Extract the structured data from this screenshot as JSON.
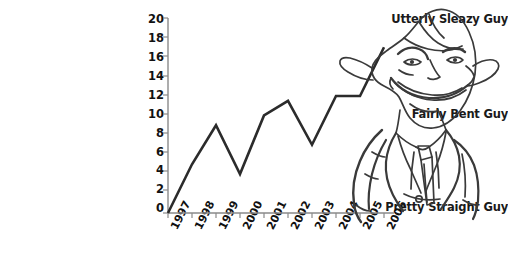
{
  "chart_data": {
    "type": "line",
    "title": "",
    "subtitle": "",
    "xlabel": "",
    "ylabel": "",
    "grid": false,
    "legend_position": "none",
    "categories": [
      "1997",
      "1998",
      "1999",
      "2000",
      "2001",
      "2002",
      "2003",
      "2004",
      "2005",
      "2006"
    ],
    "x": [
      "1997",
      "1998",
      "1999",
      "2000",
      "2001",
      "2002",
      "2003",
      "2004",
      "2005",
      "2006"
    ],
    "values": [
      0,
      5,
      9,
      4,
      10,
      11.5,
      7,
      12,
      12,
      17
    ],
    "series": [
      {
        "name": "sleaziness",
        "values": [
          0,
          5,
          9,
          4,
          10,
          11.5,
          7,
          12,
          12,
          17
        ],
        "color": "#2b2b2b"
      }
    ],
    "ylim": [
      0,
      20
    ],
    "ytick_values": [
      0,
      2,
      4,
      6,
      8,
      10,
      12,
      14,
      16,
      18,
      20
    ],
    "ytick_labels": [
      "0",
      "2",
      "4",
      "6",
      "8",
      "10",
      "12",
      "14",
      "16",
      "18",
      "20"
    ],
    "y_category_annotations": [
      {
        "value": 20,
        "label": "Utterly Sleazy Guy"
      },
      {
        "value": 10,
        "label": "Fairly Bent Guy"
      },
      {
        "value": 0,
        "label": "Pretty Straight Guy"
      }
    ],
    "axis_color": "#808080",
    "background_color": "#ffffff",
    "annotations": [
      "cartoon sleazy businessman illustration overlapping right side of plot"
    ]
  },
  "axis": {
    "y_labels": [
      "20",
      "18",
      "16",
      "14",
      "12",
      "10",
      "8",
      "6",
      "4",
      "2",
      "0"
    ],
    "x_labels": [
      "1997",
      "1998",
      "1999",
      "2000",
      "2001",
      "2002",
      "2003",
      "2004",
      "2005",
      "2006"
    ]
  },
  "category_labels": {
    "top": "Utterly Sleazy Guy",
    "middle": "Fairly Bent Guy",
    "bottom": "Pretty Straight Guy"
  },
  "mascot": {
    "name": "sleazy-businessman-cartoon",
    "line_color": "#3a3a3a"
  }
}
